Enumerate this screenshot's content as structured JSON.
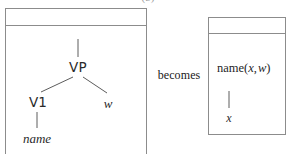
{
  "figure": {
    "caption_remnant": "(b)",
    "connector_label": "becomes",
    "accent_border_color": "#8c8c8c",
    "edge_color": "#5c5c5c",
    "background_color": "#ffffff"
  },
  "left_panel": {
    "name": "source-structure-panel",
    "tree": {
      "type": "syntax-tree",
      "root_stub": true,
      "nodes": [
        {
          "id": "vp",
          "label": "VP",
          "style": "category",
          "x": 78,
          "y": 61
        },
        {
          "id": "v1",
          "label": "V1",
          "style": "category",
          "x": 38,
          "y": 96
        },
        {
          "id": "w",
          "label": "w",
          "style": "terminal",
          "x": 108,
          "y": 97
        },
        {
          "id": "name",
          "label": "name",
          "style": "terminal",
          "x": 37,
          "y": 132
        }
      ],
      "edges": [
        {
          "from": "root-stub",
          "to": "vp"
        },
        {
          "from": "vp",
          "to": "v1"
        },
        {
          "from": "vp",
          "to": "w"
        },
        {
          "from": "v1",
          "to": "name"
        }
      ]
    }
  },
  "right_panel": {
    "name": "result-structure-panel",
    "formula": {
      "functor": "name",
      "open_paren": "(",
      "arg1": "x",
      "separator": ",",
      "arg2": "w",
      "close_paren": ")",
      "full_text": "name(x, w)"
    },
    "leaf": {
      "label": "x",
      "style": "terminal"
    }
  }
}
